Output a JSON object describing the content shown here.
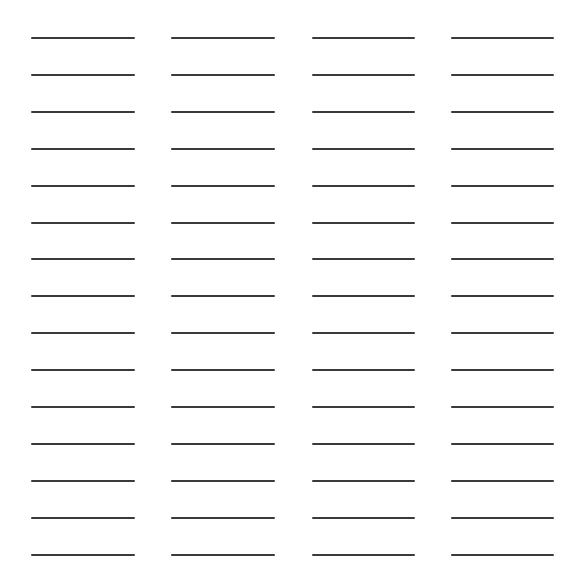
{
  "page": {
    "type": "blank-lines-worksheet",
    "rows": 15,
    "columns": 4,
    "line_color": "#3a3a3a",
    "background": "#ffffff",
    "line_thickness_px": 2,
    "first_line_y": 38,
    "row_spacing_px": 36.9,
    "column_x_ranges": [
      [
        31,
        135
      ],
      [
        171,
        275
      ],
      [
        312,
        415
      ],
      [
        451,
        554
      ]
    ],
    "entries": []
  }
}
